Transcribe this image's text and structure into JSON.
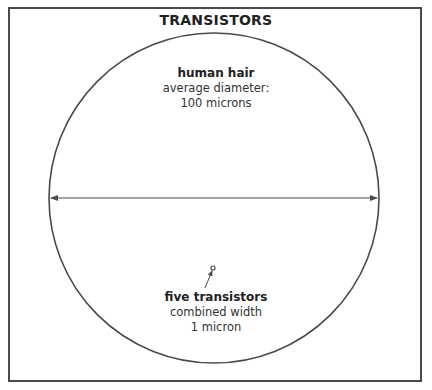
{
  "title": "TRANSISTORS",
  "hair": {
    "heading": "human hair",
    "line1": "average diameter:",
    "line2": "100 microns"
  },
  "transistors": {
    "heading": "five transistors",
    "line1": "combined width",
    "line2": "1 micron"
  },
  "colors": {
    "stroke": "#4a4a4a",
    "background": "#ffffff"
  }
}
